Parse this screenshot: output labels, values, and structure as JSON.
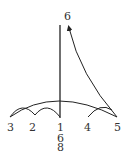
{
  "diagram": {
    "type": "conducting-pattern",
    "time_signature": {
      "numerator": "6",
      "denominator": "8"
    },
    "beats": [
      {
        "label": "1",
        "x": 60
      },
      {
        "label": "2",
        "x": 33
      },
      {
        "label": "3",
        "x": 11
      },
      {
        "label": "4",
        "x": 87
      },
      {
        "label": "5",
        "x": 117
      },
      {
        "label": "6",
        "x": 67
      }
    ],
    "colors": {
      "stroke": "#222222",
      "text": "#333333",
      "background": "#ffffff"
    }
  }
}
